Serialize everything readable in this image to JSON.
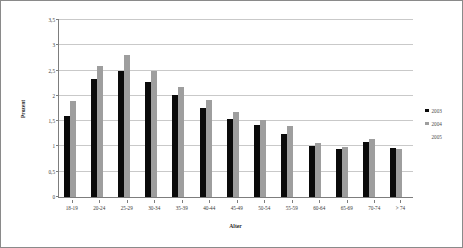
{
  "chart_data": {
    "type": "bar",
    "title": "",
    "xlabel": "Alter",
    "ylabel": "Prozent",
    "ylim": [
      0,
      3.5
    ],
    "ytick_step": 0.5,
    "yticks": [
      "0",
      "0,5",
      "1",
      "1,5",
      "2",
      "2,5",
      "3",
      "3,5"
    ],
    "ytick_values": [
      0,
      0.5,
      1,
      1.5,
      2,
      2.5,
      3,
      3.5
    ],
    "grid": "horizontal",
    "legend_position": "right",
    "categories": [
      "18-19",
      "20-24",
      "25-29",
      "30-34",
      "35-39",
      "40-44",
      "45-49",
      "50-54",
      "55-59",
      "60-64",
      "65-69",
      "70-74",
      "> 74"
    ],
    "series": [
      {
        "name": "2003",
        "color": "#0a0a0a",
        "values": [
          1.6,
          2.34,
          2.5,
          2.28,
          2.01,
          1.77,
          1.54,
          1.43,
          1.25,
          1.0,
          0.94,
          1.09,
          0.97
        ]
      },
      {
        "name": "2004",
        "color": "#9e9e9e",
        "values": [
          1.9,
          2.59,
          2.8,
          2.5,
          2.18,
          1.92,
          1.68,
          1.53,
          1.4,
          1.07,
          0.99,
          1.15,
          0.95
        ]
      },
      {
        "name": "2005",
        "color": "#fdfdfd",
        "values": [
          0,
          0,
          0,
          0,
          0,
          0,
          0,
          0,
          0,
          0,
          0,
          0,
          0
        ]
      }
    ]
  },
  "legend": {
    "items": [
      {
        "label": "2003"
      },
      {
        "label": "2004"
      },
      {
        "label": "2005"
      }
    ]
  }
}
